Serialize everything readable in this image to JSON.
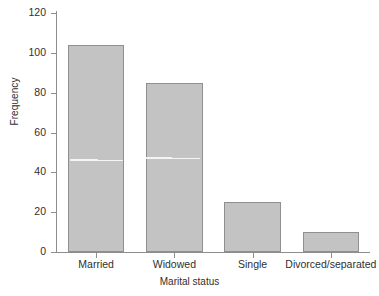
{
  "chart_data": {
    "type": "bar",
    "title": "",
    "xlabel": "Marital status",
    "ylabel": "Frequency",
    "categories": [
      "Married",
      "Widowed",
      "Single",
      "Divorced/separated"
    ],
    "values": [
      104,
      85,
      25,
      10
    ],
    "ylim": [
      0,
      120
    ],
    "yticks": [
      0,
      20,
      40,
      60,
      80,
      100,
      120
    ],
    "ytick_labels": [
      "0",
      "20",
      "40",
      "60",
      "80",
      "100",
      "120"
    ],
    "grid": false,
    "legend": null,
    "bar_color": "#c3c3c3",
    "bar_border_color": "#8f8f8f",
    "axis_color": "#8d8d8d",
    "text_color": "#2f2f2f"
  }
}
